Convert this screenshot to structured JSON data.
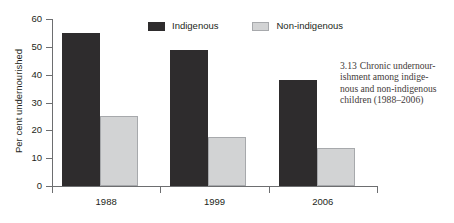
{
  "figure": {
    "caption_number": "3.13",
    "caption_lines": [
      "Chronic undernour-",
      "ishment among indige-",
      "nous and non-indigenous",
      "children (1988–2006)"
    ],
    "caption_full": "3.13  Chronic undernourishment among indigenous and non-indigenous children (1988–2006)"
  },
  "legend": {
    "items": [
      {
        "label": "Indigenous",
        "color": "#2e2c2d",
        "swatch": "dark"
      },
      {
        "label": "Non-indigenous",
        "color": "#d2d3d4",
        "swatch": "light"
      }
    ]
  },
  "chart_data": {
    "type": "bar",
    "title": "",
    "subtitle": "",
    "xlabel": "",
    "ylabel": "Per cent undernourished",
    "categories": [
      "1988",
      "1999",
      "2006"
    ],
    "series": [
      {
        "name": "Indigenous",
        "color": "#2e2c2d",
        "values": [
          55,
          49,
          38
        ]
      },
      {
        "name": "Non-indigenous",
        "color": "#d2d3d4",
        "values": [
          25,
          17.5,
          13.5
        ]
      }
    ],
    "ylim": [
      0,
      60
    ],
    "yticks": [
      0,
      10,
      20,
      30,
      40,
      50,
      60
    ],
    "ytick_labels": [
      "0",
      "10",
      "20",
      "30",
      "40",
      "50",
      "60"
    ],
    "grid": false,
    "legend_position": "top-center"
  }
}
